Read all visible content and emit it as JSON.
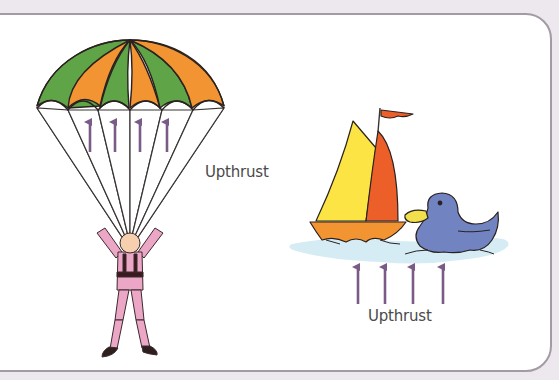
{
  "diagram": {
    "labels": {
      "parachute_force": "Upthrust",
      "water_force": "Upthrust"
    },
    "objects": [
      {
        "name": "parachute",
        "canopy_colors": [
          "#5fa447",
          "#f39432",
          "#5fa447",
          "#f39432",
          "#5fa447",
          "#f39432"
        ],
        "arrows": 4
      },
      {
        "name": "parachutist",
        "suit_color": "#eca6c6",
        "harness_color": "#3a1a1e",
        "skin_color": "#f6cfae"
      },
      {
        "name": "sailboat",
        "sail_colors": [
          "#fbe443",
          "#ec5f28"
        ],
        "hull_color": "#f39432",
        "flag_color": "#ec5f28"
      },
      {
        "name": "duck",
        "body_color": "#7183c0",
        "beak_color": "#f1e04b"
      },
      {
        "name": "water",
        "color": "#d5ecf5",
        "arrows": 4
      }
    ],
    "colors": {
      "arrow": "#7a5a87",
      "outline": "#2a2220",
      "frame_border": "#a49aa4",
      "background": "#ece8ee"
    }
  }
}
